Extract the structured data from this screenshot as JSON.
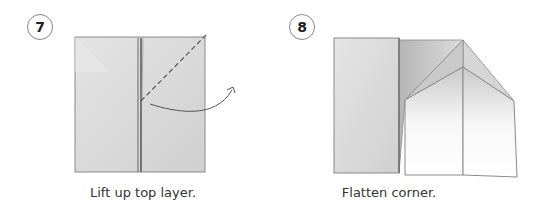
{
  "steps": [
    {
      "number": "7",
      "caption": "Lift up top layer."
    },
    {
      "number": "8",
      "caption": "Flatten corner."
    }
  ],
  "colors": {
    "paper": "#d9d9d9",
    "paper_light": "#ececec",
    "edge": "#7a7a7a",
    "white_face": "#ffffff"
  }
}
